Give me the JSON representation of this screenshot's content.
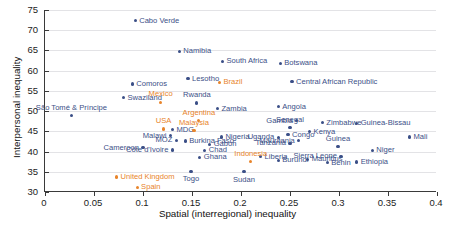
{
  "chart_data": {
    "type": "scatter",
    "title": "",
    "xlabel": "Spatial (interregional) inequality",
    "ylabel": "Interpersonal inequality",
    "xlim": [
      0,
      0.4
    ],
    "ylim": [
      30,
      75
    ],
    "xticks": [
      "0",
      "0.05",
      "0.1",
      "0.15",
      "0.2",
      "0.25",
      "0.3",
      "0.35",
      "0.4"
    ],
    "xtick_values": [
      0,
      0.05,
      0.1,
      0.15,
      0.2,
      0.25,
      0.3,
      0.35,
      0.4
    ],
    "yticks": [
      "30",
      "35",
      "40",
      "45",
      "50",
      "55",
      "60",
      "65",
      "70",
      "75"
    ],
    "ytick_values": [
      30,
      35,
      40,
      45,
      50,
      55,
      60,
      65,
      70,
      75
    ],
    "grid": "horizontal",
    "legend": "none",
    "colors": {
      "african": "#3b4f87",
      "comparator": "#e8842a",
      "axis": "#3a3a3a",
      "gridline": "#e3e3e6"
    },
    "series": [
      {
        "name": "African countries",
        "color": "#3b4f87",
        "points": [
          {
            "label": "Cabo Verde",
            "x": 0.092,
            "y": 72.4,
            "pos": "lr"
          },
          {
            "label": "Namibia",
            "x": 0.137,
            "y": 64.8,
            "pos": "lr"
          },
          {
            "label": "South Africa",
            "x": 0.181,
            "y": 62.3,
            "pos": "lr"
          },
          {
            "label": "Botswana",
            "x": 0.24,
            "y": 61.8,
            "pos": "lr"
          },
          {
            "label": "Central African Republic",
            "x": 0.252,
            "y": 57.3,
            "pos": "lr"
          },
          {
            "label": "Lesotho",
            "x": 0.146,
            "y": 58.0,
            "pos": "lr"
          },
          {
            "label": "Comoros",
            "x": 0.089,
            "y": 56.7,
            "pos": "lr"
          },
          {
            "label": "Swaziland",
            "x": 0.08,
            "y": 53.3,
            "pos": "lr"
          },
          {
            "label": "Rwanda",
            "x": 0.155,
            "y": 52.0,
            "pos": "lt"
          },
          {
            "label": "Angola",
            "x": 0.238,
            "y": 51.1,
            "pos": "lr"
          },
          {
            "label": "Zambia",
            "x": 0.176,
            "y": 50.6,
            "pos": "lr"
          },
          {
            "label": "São Tomé & Príncipe",
            "x": 0.027,
            "y": 48.9,
            "pos": "lt"
          },
          {
            "label": "Gambia",
            "x": 0.257,
            "y": 47.6,
            "pos": "ll"
          },
          {
            "label": "Zimbabwe",
            "x": 0.283,
            "y": 47.1,
            "pos": "lr"
          },
          {
            "label": "Guinea-Bissau",
            "x": 0.318,
            "y": 47.0,
            "pos": "lr"
          },
          {
            "label": "Senegal",
            "x": 0.25,
            "y": 45.9,
            "pos": "lt"
          },
          {
            "label": "MDG",
            "x": 0.13,
            "y": 45.4,
            "pos": "lr"
          },
          {
            "label": "Kenya",
            "x": 0.27,
            "y": 44.9,
            "pos": "lr"
          },
          {
            "label": "Congo",
            "x": 0.248,
            "y": 44.2,
            "pos": "lr"
          },
          {
            "label": "Malawi",
            "x": 0.128,
            "y": 43.9,
            "pos": "ll"
          },
          {
            "label": "Nigeria",
            "x": 0.18,
            "y": 43.6,
            "pos": "lr"
          },
          {
            "label": "Uganda",
            "x": 0.238,
            "y": 43.5,
            "pos": "ll"
          },
          {
            "label": "Mali",
            "x": 0.372,
            "y": 43.6,
            "pos": "lr"
          },
          {
            "label": "MOZ",
            "x": 0.134,
            "y": 42.8,
            "pos": "ll"
          },
          {
            "label": "Burkina Faso",
            "x": 0.143,
            "y": 42.6,
            "pos": "lr"
          },
          {
            "label": "Mauritania",
            "x": 0.259,
            "y": 42.7,
            "pos": "ll"
          },
          {
            "label": "Tanzania",
            "x": 0.25,
            "y": 42.0,
            "pos": "ll"
          },
          {
            "label": "Gabon",
            "x": 0.168,
            "y": 41.8,
            "pos": "lr"
          },
          {
            "label": "Cameroon",
            "x": 0.1,
            "y": 41.0,
            "pos": "ll"
          },
          {
            "label": "Côte d'Ivoire",
            "x": 0.13,
            "y": 40.4,
            "pos": "ll"
          },
          {
            "label": "Chad",
            "x": 0.163,
            "y": 40.3,
            "pos": "lr"
          },
          {
            "label": "Guinea",
            "x": 0.299,
            "y": 41.2,
            "pos": "lt"
          },
          {
            "label": "Niger",
            "x": 0.334,
            "y": 40.3,
            "pos": "lr"
          },
          {
            "label": "Ghana",
            "x": 0.158,
            "y": 38.6,
            "pos": "lr"
          },
          {
            "label": "Liberia",
            "x": 0.22,
            "y": 38.7,
            "pos": "lr"
          },
          {
            "label": "Sierra Leone",
            "x": 0.302,
            "y": 38.8,
            "pos": "ll"
          },
          {
            "label": "Burundi",
            "x": 0.238,
            "y": 37.8,
            "pos": "lr"
          },
          {
            "label": "Mauritius",
            "x": 0.268,
            "y": 38.1,
            "pos": "lr"
          },
          {
            "label": "Benin",
            "x": 0.288,
            "y": 37.2,
            "pos": "lr"
          },
          {
            "label": "Ethiopia",
            "x": 0.318,
            "y": 37.4,
            "pos": "lr"
          },
          {
            "label": "Togo",
            "x": 0.149,
            "y": 35.1,
            "pos": "lb"
          },
          {
            "label": "Sudan",
            "x": 0.203,
            "y": 35.0,
            "pos": "lb"
          }
        ]
      },
      {
        "name": "Comparator countries",
        "color": "#e8842a",
        "points": [
          {
            "label": "Brazil",
            "x": 0.178,
            "y": 57.1,
            "pos": "lr"
          },
          {
            "label": "Mexico",
            "x": 0.118,
            "y": 52.2,
            "pos": "lt"
          },
          {
            "label": "Argentina",
            "x": 0.157,
            "y": 47.6,
            "pos": "lt"
          },
          {
            "label": "Malaysia",
            "x": 0.152,
            "y": 45.2,
            "pos": "lt"
          },
          {
            "label": "USA",
            "x": 0.121,
            "y": 45.6,
            "pos": "lt"
          },
          {
            "label": "Indonesia",
            "x": 0.21,
            "y": 37.5,
            "pos": "lt"
          },
          {
            "label": "United Kingdom",
            "x": 0.073,
            "y": 33.7,
            "pos": "lr"
          },
          {
            "label": "Spain",
            "x": 0.094,
            "y": 31.2,
            "pos": "lr"
          }
        ]
      }
    ]
  }
}
